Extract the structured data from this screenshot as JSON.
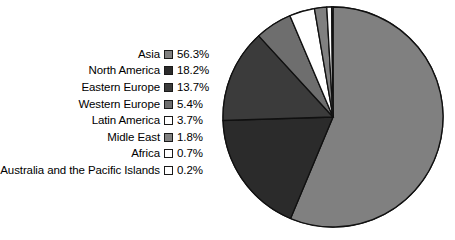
{
  "chart_data": {
    "type": "pie",
    "title": "",
    "subtitle": "",
    "xlabel": "",
    "ylabel": "",
    "legend_position": "left",
    "grid": false,
    "units": "percent",
    "start_angle_deg": 0,
    "direction": "clockwise",
    "categories": [
      "Asia",
      "North America",
      "Eastern Europe",
      "Western Europe",
      "Latin America",
      "Midle East",
      "Africa",
      "Australia and the Pacific Islands"
    ],
    "values": [
      56.3,
      18.2,
      13.7,
      5.4,
      3.7,
      1.8,
      0.7,
      0.2
    ],
    "value_labels": [
      "56.3%",
      "18.2%",
      "13.7%",
      "5.4%",
      "3.7%",
      "1.8%",
      "0.7%",
      "0.2%"
    ],
    "slice_colors": [
      "#808080",
      "#2b2b2b",
      "#3b3b3b",
      "#6e6e6e",
      "#ffffff",
      "#808080",
      "#ffffff",
      "#ffffff"
    ],
    "slice_stroke": "#101010"
  },
  "legend": {
    "items": [
      {
        "label": "Asia",
        "value": "56.3%",
        "color": "#808080"
      },
      {
        "label": "North America",
        "value": "18.2%",
        "color": "#2b2b2b"
      },
      {
        "label": "Eastern Europe",
        "value": "13.7%",
        "color": "#3b3b3b"
      },
      {
        "label": "Western Europe",
        "value": "5.4%",
        "color": "#6e6e6e"
      },
      {
        "label": "Latin America",
        "value": "3.7%",
        "color": "#ffffff"
      },
      {
        "label": "Midle East",
        "value": "1.8%",
        "color": "#808080"
      },
      {
        "label": "Africa",
        "value": "0.7%",
        "color": "#ffffff"
      },
      {
        "label": "Australia and the Pacific Islands",
        "value": "0.2%",
        "color": "#ffffff"
      }
    ]
  },
  "pie": {
    "center_x": 115,
    "center_y": 117,
    "radius": 110
  }
}
